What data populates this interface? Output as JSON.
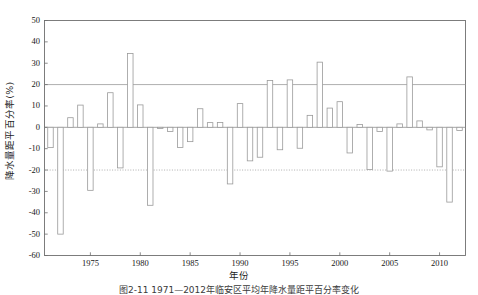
{
  "figure": {
    "caption": "图2-11  1971—2012年临安区平均年降水量距平百分率变化",
    "background": "#ffffff"
  },
  "chart_data": {
    "type": "bar",
    "title": "",
    "subtitle": "",
    "xlabel": "年份",
    "ylabel": "降水量距平百分率(%)",
    "ylim": [
      -60,
      50
    ],
    "xlim": [
      1970.4,
      2012.6
    ],
    "ytick_labels": [
      "50",
      "40",
      "30",
      "20",
      "10",
      "0",
      "-10",
      "-20",
      "-30",
      "-40",
      "-50",
      "-60"
    ],
    "ytick_values": [
      50,
      40,
      30,
      20,
      10,
      0,
      -10,
      -20,
      -30,
      -40,
      -50,
      -60
    ],
    "xtick_labels": [
      "1975",
      "1980",
      "1985",
      "1990",
      "1995",
      "2000",
      "2005",
      "2010"
    ],
    "xtick_values": [
      1975,
      1980,
      1985,
      1990,
      1995,
      2000,
      2005,
      2010
    ],
    "grid": false,
    "legend": "none",
    "bar_style": {
      "fill": "#ffffff",
      "edge": "#9a9a9a",
      "edge_width": 0.8
    },
    "reference_lines": [
      {
        "name": "upper-threshold",
        "value": 20,
        "style": "solid",
        "color": "#9a9a9a"
      },
      {
        "name": "lower-threshold",
        "value": -20,
        "style": "dotted",
        "color": "#9a9a9a"
      }
    ],
    "categories": [
      1971,
      1972,
      1973,
      1974,
      1975,
      1976,
      1977,
      1978,
      1979,
      1980,
      1981,
      1982,
      1983,
      1984,
      1985,
      1986,
      1987,
      1988,
      1989,
      1990,
      1991,
      1992,
      1993,
      1994,
      1995,
      1996,
      1997,
      1998,
      1999,
      2000,
      2001,
      2002,
      2003,
      2004,
      2005,
      2006,
      2007,
      2008,
      2009,
      2010,
      2011,
      2012
    ],
    "values": [
      -9.5,
      -50.0,
      4.5,
      10.4,
      -29.5,
      1.6,
      16.2,
      -19.0,
      34.6,
      10.5,
      -36.5,
      -0.4,
      -2.0,
      -9.4,
      -6.7,
      8.7,
      2.2,
      2.3,
      -26.5,
      11.1,
      -15.7,
      -14.0,
      21.9,
      -10.5,
      22.2,
      -9.8,
      5.6,
      30.5,
      9.0,
      12.0,
      -12.0,
      1.3,
      -19.8,
      -2.0,
      -20.5,
      1.6,
      23.6,
      3.0,
      -1.2,
      -18.5,
      -35.0,
      -1.5
    ],
    "units": "%"
  }
}
